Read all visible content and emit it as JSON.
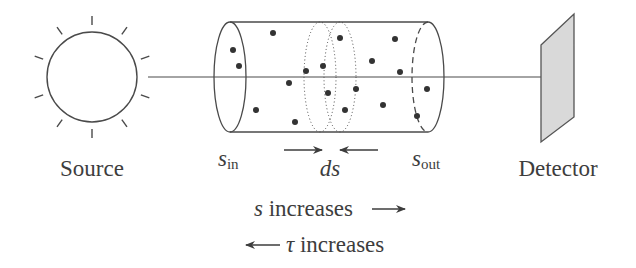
{
  "figure": {
    "source_label": "Source",
    "detector_label": "Detector",
    "s_in": {
      "base": "s",
      "sub": "in"
    },
    "s_out": {
      "base": "s",
      "sub": "out"
    },
    "ds_label": "ds",
    "s_increases": {
      "symbol": "s",
      "text": " increases"
    },
    "tau_increases": {
      "symbol": "τ",
      "text": " increases"
    }
  },
  "colors": {
    "line": "#4a4a4a",
    "dot": "#333333",
    "detector_fill": "#d9d9d9",
    "text": "#3d3d3d"
  },
  "icons": {
    "source": "sun-icon",
    "detector": "detector-plate-icon"
  }
}
